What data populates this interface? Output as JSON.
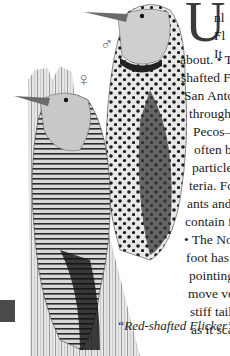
{
  "page": {
    "drop_cap": "U",
    "text_lines": [
      {
        "text": "nl",
        "x": 214,
        "y": 2
      },
      {
        "text": "Fl",
        "x": 214,
        "y": 20
      },
      {
        "text": "It",
        "x": 214,
        "y": 38
      },
      {
        "text": "about. • Tw",
        "x": 180,
        "y": 44
      },
      {
        "text": "shafted Flic",
        "x": 181,
        "y": 62
      },
      {
        "text": "San Anton",
        "x": 184,
        "y": 80
      },
      {
        "text": "througho",
        "x": 189,
        "y": 98
      },
      {
        "text": "Pecos—",
        "x": 193,
        "y": 116
      },
      {
        "text": "often b",
        "x": 194,
        "y": 134
      },
      {
        "text": "particles",
        "x": 192,
        "y": 152
      },
      {
        "text": "teria. For",
        "x": 189,
        "y": 170
      },
      {
        "text": "ants and",
        "x": 187,
        "y": 188
      },
      {
        "text": "contain fo",
        "x": 185,
        "y": 206
      },
      {
        "text": "• The No",
        "x": 184,
        "y": 224
      },
      {
        "text": "foot has",
        "x": 186,
        "y": 242
      },
      {
        "text": "pointing",
        "x": 189,
        "y": 260
      },
      {
        "text": "move ver",
        "x": 188,
        "y": 278
      },
      {
        "text": "stiff tail",
        "x": 190,
        "y": 296
      },
      {
        "text": "as it scale",
        "x": 191,
        "y": 314
      }
    ],
    "caption": "“Red-shafted Flicker”",
    "symbols": {
      "male": "♂",
      "female": "♀"
    },
    "colors": {
      "ink": "#1a1a1a",
      "paper": "#ffffff",
      "tab": "#4a4a4a"
    }
  }
}
